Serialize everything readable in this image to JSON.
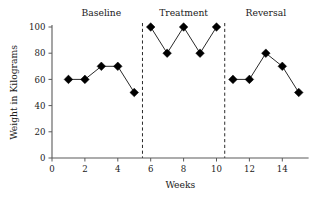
{
  "chart_data": {
    "type": "line",
    "title": "",
    "xlabel": "Weeks",
    "ylabel": "Weight in Kilograms",
    "xlim": [
      0,
      15.6
    ],
    "ylim": [
      0,
      104
    ],
    "xticks": [
      0,
      2,
      4,
      6,
      8,
      10,
      12,
      14
    ],
    "yticks": [
      0,
      20,
      40,
      60,
      80,
      100
    ],
    "grid": false,
    "legend": "none",
    "marker": "diamond",
    "marker_color": "#000000",
    "line_color": "#111111",
    "x": [
      1,
      2,
      3,
      4,
      5,
      6,
      7,
      8,
      9,
      10,
      11,
      12,
      13,
      14,
      15
    ],
    "values": [
      60,
      60,
      70,
      70,
      50,
      100,
      80,
      100,
      80,
      100,
      60,
      60,
      80,
      70,
      50
    ],
    "series": [
      {
        "name": "Baseline",
        "x": [
          1,
          2,
          3,
          4,
          5
        ],
        "values": [
          60,
          60,
          70,
          70,
          50
        ]
      },
      {
        "name": "Treatment",
        "x": [
          6,
          7,
          8,
          9,
          10
        ],
        "values": [
          100,
          80,
          100,
          80,
          100
        ]
      },
      {
        "name": "Reversal",
        "x": [
          11,
          12,
          13,
          14,
          15
        ],
        "values": [
          60,
          60,
          80,
          70,
          50
        ]
      }
    ],
    "phases": [
      {
        "label": "Baseline",
        "x_center": 3.0,
        "x_start": 0.4,
        "x_end": 5.5
      },
      {
        "label": "Treatment",
        "x_center": 8.0,
        "x_start": 5.5,
        "x_end": 10.5
      },
      {
        "label": "Reversal",
        "x_center": 13.0,
        "x_start": 10.5,
        "x_end": 15.6
      }
    ],
    "dividers": [
      5.5,
      10.5
    ],
    "annotations": []
  }
}
